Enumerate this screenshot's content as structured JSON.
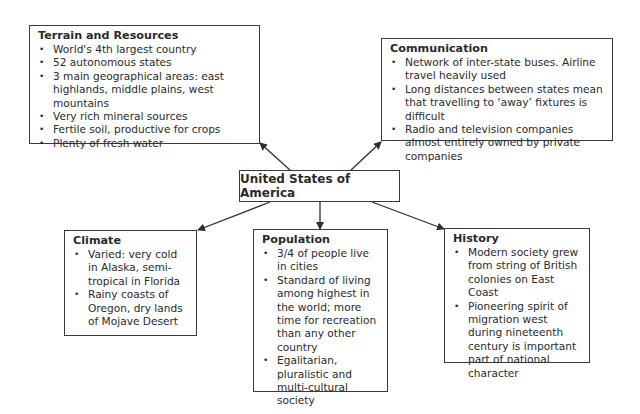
{
  "title": "United States of America",
  "nodes": {
    "terrain": {
      "heading": "Terrain and Resources",
      "items": [
        "World's 4th largest country",
        "52 autonomous states",
        "3 main geographical areas: east highlands, middle plains, west mountains",
        "Very rich mineral sources",
        "Fertile soil, productive for crops",
        "Plenty of fresh water"
      ]
    },
    "communication": {
      "heading": "Communication",
      "items": [
        "Network of inter-state buses. Airline travel heavily used",
        "Long distances between states mean that travelling to ‘away’ fixtures is difficult",
        "Radio and television companies almost entirely owned by private companies"
      ]
    },
    "climate": {
      "heading": "Climate",
      "items": [
        "Varied: very cold in Alaska, semi-tropical in Florida",
        "Rainy coasts of Oregon, dry lands of Mojave Desert"
      ]
    },
    "population": {
      "heading": "Population",
      "items": [
        "3/4 of people live in cities",
        "Standard of living among highest in the world; more time for recreation than any other country",
        "Egalitarian, pluralistic and multi-cultural society"
      ]
    },
    "history": {
      "heading": "History",
      "items": [
        "Modern society grew from string of British colonies on East Coast",
        "Pioneering spirit of migration west during nineteenth century is important part of national character"
      ]
    }
  },
  "colors": {
    "line": "#2f2f2f",
    "text": "#2a2a2a",
    "background": "#ffffff"
  }
}
